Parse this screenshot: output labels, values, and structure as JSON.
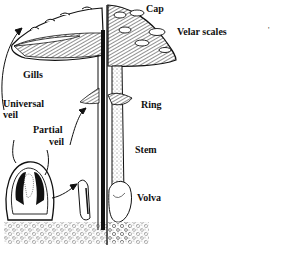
{
  "figure": {
    "labels": {
      "cap": "Cap",
      "velar_scales": "Velar scales",
      "gills": "Gills",
      "universal_veil_1": "Universal",
      "universal_veil_2": "veil",
      "partial_veil_1": "Partial",
      "partial_veil_2": "veil",
      "ring": "Ring",
      "stem": "Stem",
      "volva": "Volva"
    },
    "stray_mark": "'"
  }
}
